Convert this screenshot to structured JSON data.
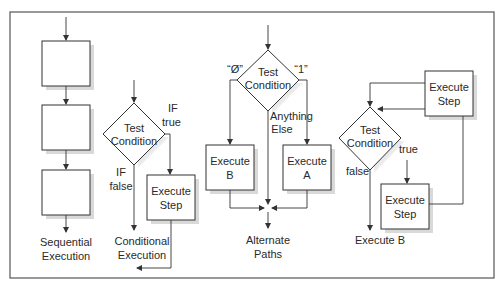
{
  "diagrams": {
    "sequential": {
      "caption_line1": "Sequential",
      "caption_line2": "Execution"
    },
    "conditional": {
      "decision_line1": "Test",
      "decision_line2": "Condition",
      "true_label_line1": "IF",
      "true_label_line2": "true",
      "false_label_line1": "IF",
      "false_label_line2": "false",
      "step_line1": "Execute",
      "step_line2": "Step",
      "caption_line1": "Conditional",
      "caption_line2": "Execution"
    },
    "alternate": {
      "decision_line1": "Test",
      "decision_line2": "Condition",
      "left_label": "“Ø”",
      "right_label": "“1”",
      "middle_label_line1": "Anything",
      "middle_label_line2": "Else",
      "box_b_line1": "Execute",
      "box_b_line2": "B",
      "box_a_line1": "Execute",
      "box_a_line2": "A",
      "caption_line1": "Alternate",
      "caption_line2": "Paths"
    },
    "loop": {
      "top_step_line1": "Execute",
      "top_step_line2": "Step",
      "decision_line1": "Test",
      "decision_line2": "Condition",
      "true_label": "true",
      "false_label": "false",
      "bottom_step_line1": "Execute",
      "bottom_step_line2": "Step",
      "exit_label": "Execute B"
    }
  },
  "colors": {
    "stroke": "#333333",
    "shadow": "#d9d9d9",
    "background": "#ffffff"
  }
}
